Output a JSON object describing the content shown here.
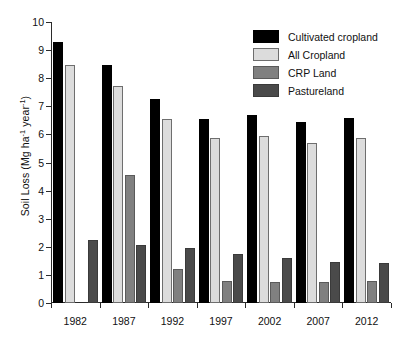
{
  "chart_data": {
    "type": "bar",
    "title": "",
    "subtitle": "",
    "xlabel": "",
    "ylabel": "Soil Loss (Mg ha⁻¹ year⁻¹)",
    "ylabel_parts": {
      "prefix": "Soil Loss (Mg ha",
      "sup1": "-1",
      "middle": " year",
      "sup2": "-1",
      "suffix": ")"
    },
    "categories": [
      "1982",
      "1987",
      "1992",
      "1997",
      "2002",
      "2007",
      "2012"
    ],
    "series": [
      {
        "name": "Cultivated cropland",
        "color": "#000000",
        "values": [
          9.28,
          8.48,
          7.25,
          6.55,
          6.7,
          6.45,
          6.6
        ]
      },
      {
        "name": "All Cropland",
        "color": "#dcdcdc",
        "values": [
          8.48,
          7.74,
          6.54,
          5.89,
          5.96,
          5.7,
          5.87
        ]
      },
      {
        "name": "CRP Land",
        "color": "#808080",
        "values": [
          0.0,
          4.57,
          1.21,
          0.77,
          0.76,
          0.74,
          0.8
        ]
      },
      {
        "name": "Pastureland",
        "color": "#4a4a4a",
        "values": [
          2.23,
          2.06,
          1.95,
          1.74,
          1.61,
          1.46,
          1.44
        ]
      }
    ],
    "ylim": [
      0,
      10
    ],
    "ytick_labels": [
      "0",
      "1",
      "2",
      "3",
      "4",
      "5",
      "6",
      "7",
      "8",
      "9",
      "10"
    ],
    "ytick_values": [
      0,
      1,
      2,
      3,
      4,
      5,
      6,
      7,
      8,
      9,
      10
    ],
    "grid": false,
    "legend_position": "top-right",
    "axis_color": "#2b2b2b"
  },
  "legend": {
    "entries": [
      {
        "label": "Cultivated cropland"
      },
      {
        "label": "All Cropland"
      },
      {
        "label": "CRP Land"
      },
      {
        "label": "Pastureland"
      }
    ]
  }
}
